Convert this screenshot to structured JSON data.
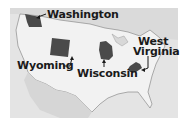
{
  "map": {
    "title": "",
    "colors": {
      "background": "#ffffff",
      "surrounding_land": "#dcdcdc",
      "us_land": "#efefef",
      "highlighted_state": "#4a4a4a",
      "border_line": "#707070",
      "label_text": "#1a1a1a"
    },
    "labels": [
      {
        "id": "washington",
        "text": "Washington"
      },
      {
        "id": "wyoming",
        "text": "Wyoming"
      },
      {
        "id": "wisconsin",
        "text": "Wisconsin"
      },
      {
        "id": "west-virginia-line1",
        "text": "West"
      },
      {
        "id": "west-virginia-line2",
        "text": "Virginia"
      }
    ],
    "highlighted_states": [
      "Washington",
      "Wyoming",
      "Wisconsin",
      "West Virginia"
    ]
  }
}
